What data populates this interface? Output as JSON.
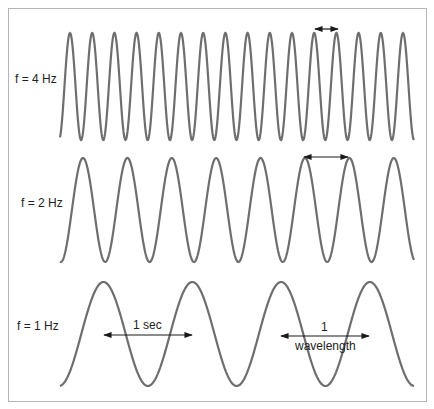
{
  "diagram": {
    "waves": [
      {
        "label": "f = 4 Hz",
        "frequency_hz": 4,
        "start_x": 60,
        "end_x": 414,
        "first_peak_x": 70,
        "period_px": 22.2,
        "center_y": 86.5,
        "amplitude_px": 53.5,
        "label_x": 15,
        "label_y": 80
      },
      {
        "label": "f = 2 Hz",
        "frequency_hz": 2,
        "start_x": 60,
        "end_x": 414,
        "first_peak_x": 83,
        "period_px": 44.4,
        "center_y": 210,
        "amplitude_px": 52,
        "label_x": 21,
        "label_y": 203
      },
      {
        "label": "f = 1 Hz",
        "frequency_hz": 1,
        "start_x": 60,
        "end_x": 414,
        "first_peak_x": 103.5,
        "period_px": 88.8,
        "center_y": 334,
        "amplitude_px": 52,
        "label_x": 17,
        "label_y": 327
      }
    ],
    "annotations": [
      {
        "type": "double-arrow",
        "x1": 315,
        "x2": 338,
        "y": 29,
        "text": ""
      },
      {
        "type": "double-arrow",
        "x1": 304,
        "x2": 348,
        "y": 157,
        "text": ""
      },
      {
        "type": "double-arrow",
        "x1": 104,
        "x2": 192,
        "y": 335,
        "text": "1 sec",
        "text_x": 134,
        "text_y": 320
      },
      {
        "type": "double-arrow",
        "x1": 281,
        "x2": 369,
        "y": 336,
        "text": "1",
        "text_x": 321,
        "text_y": 321,
        "text2": "wavelength",
        "text2_x": 295,
        "text2_y": 341
      }
    ],
    "colors": {
      "wave": "#6e6e6e",
      "arrow": "#1a1a1a",
      "border": "#b5b5b5",
      "text": "#222222"
    }
  },
  "labels": {
    "f4": "f = 4 Hz",
    "f2": "f = 2 Hz",
    "f1": "f = 1 Hz",
    "one_sec": "1 sec",
    "one": "1",
    "wavelength": "wavelength"
  }
}
